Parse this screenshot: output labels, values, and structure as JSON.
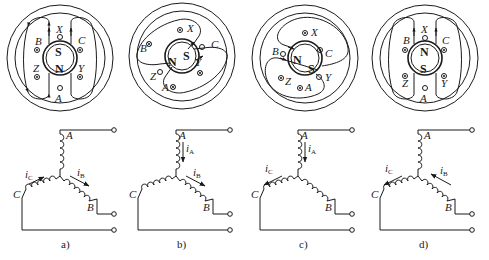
{
  "figure": {
    "panels": [
      {
        "id": "a",
        "caption": "a)",
        "rotor": {
          "top_pole": "S",
          "bottom_pole": "N",
          "angle": 0
        },
        "slots": [
          {
            "label": "X",
            "symbol": "out"
          },
          {
            "label": "C",
            "symbol": "in"
          },
          {
            "label": "Y",
            "symbol": "in"
          },
          {
            "label": "A",
            "symbol": "out"
          },
          {
            "label": "Z",
            "symbol": "in"
          },
          {
            "label": "B",
            "symbol": "in"
          }
        ],
        "currents": [
          {
            "label": "i",
            "sub": "C",
            "direction": "toward-junction"
          },
          {
            "label": "i",
            "sub": "B",
            "direction": "away-from-junction"
          }
        ]
      },
      {
        "id": "b",
        "caption": "b)",
        "rotor": {
          "top_pole": "S",
          "bottom_pole": "N",
          "angle": 60
        },
        "slots": [
          {
            "label": "X",
            "symbol": "dot"
          },
          {
            "label": "C",
            "symbol": "out"
          },
          {
            "label": "Y",
            "symbol": "cross"
          },
          {
            "label": "A",
            "symbol": "cross"
          },
          {
            "label": "Z",
            "symbol": "out"
          },
          {
            "label": "B",
            "symbol": "cross"
          }
        ],
        "currents": [
          {
            "label": "i",
            "sub": "A",
            "direction": "down"
          },
          {
            "label": "i",
            "sub": "B",
            "direction": "away-from-junction"
          }
        ]
      },
      {
        "id": "c",
        "caption": "c)",
        "rotor": {
          "top_pole": "S",
          "bottom_pole": "N",
          "angle": 120
        },
        "slots": [
          {
            "label": "X",
            "symbol": "dot"
          },
          {
            "label": "C",
            "symbol": "dot"
          },
          {
            "label": "Y",
            "symbol": "out"
          },
          {
            "label": "A",
            "symbol": "dot"
          },
          {
            "label": "Z",
            "symbol": "dot"
          },
          {
            "label": "B",
            "symbol": "out"
          }
        ],
        "currents": [
          {
            "label": "i",
            "sub": "A",
            "direction": "down"
          },
          {
            "label": "i",
            "sub": "C",
            "direction": "away-from-junction"
          }
        ]
      },
      {
        "id": "d",
        "caption": "d)",
        "rotor": {
          "top_pole": "N",
          "bottom_pole": "S",
          "angle": 0
        },
        "slots": [
          {
            "label": "X",
            "symbol": "out"
          },
          {
            "label": "C",
            "symbol": "in"
          },
          {
            "label": "Y",
            "symbol": "in"
          },
          {
            "label": "A",
            "symbol": "out"
          },
          {
            "label": "Z",
            "symbol": "in"
          },
          {
            "label": "B",
            "symbol": "in"
          }
        ],
        "currents": [
          {
            "label": "i",
            "sub": "C",
            "direction": "away-from-junction"
          },
          {
            "label": "i",
            "sub": "B",
            "direction": "toward-junction"
          }
        ]
      }
    ],
    "winding_labels": {
      "A": "A",
      "B": "B",
      "C": "C"
    }
  }
}
